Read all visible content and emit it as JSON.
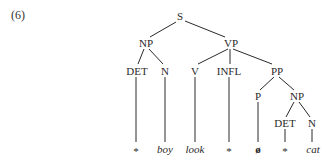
{
  "example_number": "(6)",
  "tree": {
    "root": "S",
    "nodes": {
      "s": {
        "label": "S",
        "x": 180,
        "y": 20
      },
      "np1": {
        "label": "NP",
        "x": 146,
        "y": 46
      },
      "vp": {
        "label": "VP",
        "x": 231,
        "y": 46
      },
      "det1": {
        "label": "DET",
        "x": 137,
        "y": 74
      },
      "n1": {
        "label": "N",
        "x": 165,
        "y": 74
      },
      "v": {
        "label": "V",
        "x": 195,
        "y": 74
      },
      "infl": {
        "label": "INFL",
        "x": 229,
        "y": 74
      },
      "pp": {
        "label": "PP",
        "x": 277,
        "y": 74
      },
      "p": {
        "label": "P",
        "x": 258,
        "y": 99
      },
      "np2": {
        "label": "NP",
        "x": 297,
        "y": 99
      },
      "det2": {
        "label": "DET",
        "x": 285,
        "y": 126
      },
      "n2": {
        "label": "N",
        "x": 312,
        "y": 126
      }
    },
    "leaves": [
      {
        "text": "*",
        "x": 136,
        "italic": false
      },
      {
        "text": "boy",
        "x": 165,
        "italic": true
      },
      {
        "text": "look",
        "x": 195,
        "italic": true
      },
      {
        "text": "*",
        "x": 229,
        "italic": false
      },
      {
        "text": "ø",
        "x": 258,
        "italic": false
      },
      {
        "text": "*",
        "x": 285,
        "italic": false
      },
      {
        "text": "cat",
        "x": 313,
        "italic": true
      }
    ]
  }
}
